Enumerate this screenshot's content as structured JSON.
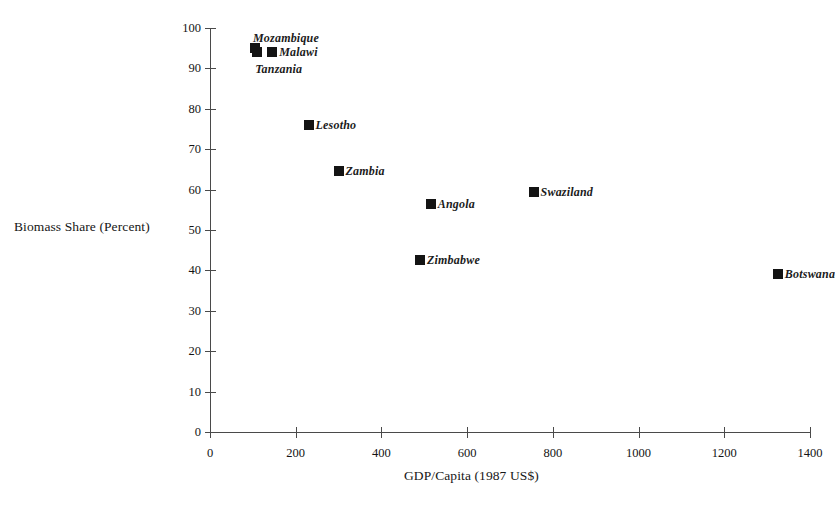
{
  "chart_data": {
    "type": "scatter",
    "title": "",
    "xlabel": "GDP/Capita  (1987 US$)",
    "ylabel": "Biomass Share (Percent)",
    "xlim": [
      0,
      1400
    ],
    "ylim": [
      0,
      100
    ],
    "xticks": [
      0,
      200,
      400,
      600,
      800,
      1000,
      1200,
      1400
    ],
    "yticks": [
      0,
      10,
      20,
      30,
      40,
      50,
      60,
      70,
      80,
      90,
      100
    ],
    "xtick_labels": [
      "0",
      "200",
      "400",
      "600",
      "800",
      "1000",
      "1200",
      "1400"
    ],
    "ytick_labels": [
      "0",
      "10",
      "20",
      "30",
      "40",
      "50",
      "60",
      "70",
      "80",
      "90",
      "100"
    ],
    "grid": false,
    "legend": "none",
    "marker": "filled-square",
    "marker_color": "#141414",
    "points": [
      {
        "label": "Mozambique",
        "x": 105,
        "y": 95,
        "label_pos": "above"
      },
      {
        "label": "Malawi",
        "x": 145,
        "y": 94,
        "label_pos": "right"
      },
      {
        "label": "Tanzania",
        "x": 110,
        "y": 94,
        "label_pos": "below"
      },
      {
        "label": "Lesotho",
        "x": 230,
        "y": 76,
        "label_pos": "right"
      },
      {
        "label": "Zambia",
        "x": 300,
        "y": 64.5,
        "label_pos": "right"
      },
      {
        "label": "Angola",
        "x": 515,
        "y": 56.5,
        "label_pos": "right"
      },
      {
        "label": "Swaziland",
        "x": 755,
        "y": 59.5,
        "label_pos": "right"
      },
      {
        "label": "Zimbabwe",
        "x": 490,
        "y": 42.5,
        "label_pos": "right"
      },
      {
        "label": "Botswana",
        "x": 1325,
        "y": 39,
        "label_pos": "right"
      }
    ]
  }
}
